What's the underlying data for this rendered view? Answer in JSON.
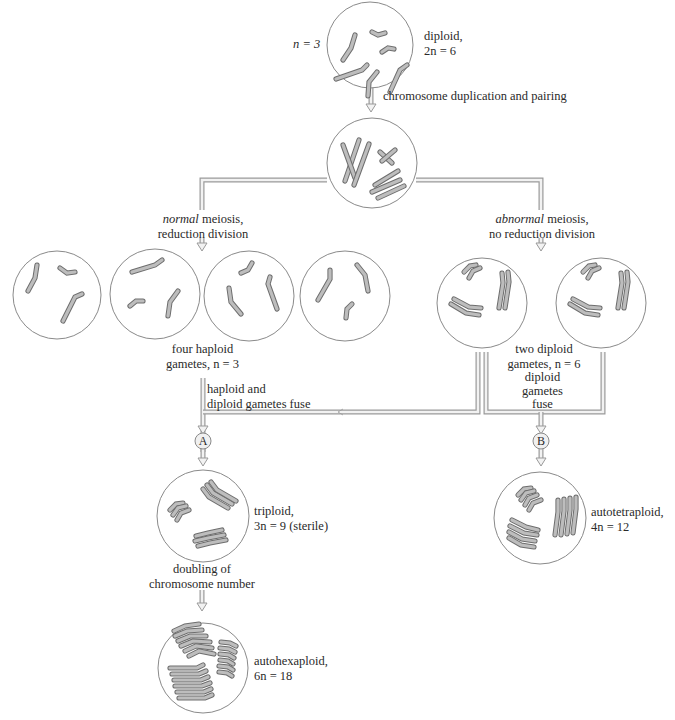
{
  "diagram": {
    "labels": {
      "n_eq_3": "n = 3",
      "diploid_title": "diploid,",
      "diploid_count": "2n = 6",
      "duplication": "chromosome duplication and pairing",
      "normal_meiosis_1": "normal meiosis,",
      "normal_meiosis_italic": "normal",
      "normal_meiosis_rest": " meiosis,",
      "normal_meiosis_2": "reduction division",
      "abnormal_meiosis_italic": "abnormal",
      "abnormal_meiosis_rest": " meiosis,",
      "abnormal_meiosis_2": "no reduction division",
      "four_haploid_1": "four haploid",
      "four_haploid_2": "gametes, n = 3",
      "two_diploid_1": "two diploid",
      "two_diploid_2": "gametes, n = 6",
      "hap_dip_fuse_1": "haploid and",
      "hap_dip_fuse_2": "diploid gametes fuse",
      "dip_fuse_1": "diploid",
      "dip_fuse_2": "gametes",
      "dip_fuse_3": "fuse",
      "node_a": "A",
      "node_b": "B",
      "triploid_1": "triploid,",
      "triploid_2": "3n = 9 (sterile)",
      "doubling_1": "doubling of",
      "doubling_2": "chromosome number",
      "autotetraploid_1": "autotetraploid,",
      "autotetraploid_2": "4n = 12",
      "autohexaploid_1": "autohexaploid,",
      "autohexaploid_2": "6n = 18"
    },
    "colors": {
      "chromosome_outline": "#6e6e6e",
      "chromosome_fill": "#bdbdbd",
      "cell_outline": "#8a8a8a",
      "pipe": "#9a9a9a",
      "text": "#2a2a2a"
    }
  }
}
